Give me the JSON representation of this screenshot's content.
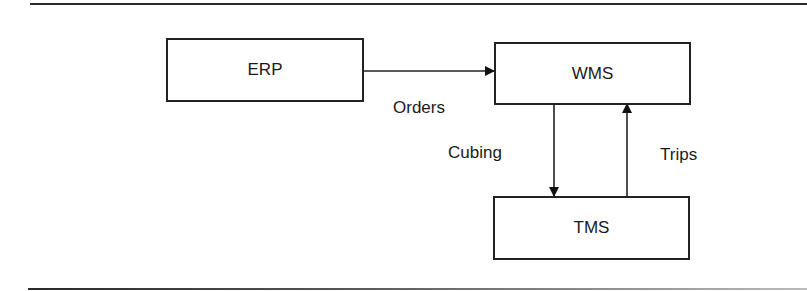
{
  "diagram": {
    "nodes": [
      {
        "id": "erp",
        "label": "ERP"
      },
      {
        "id": "wms",
        "label": "WMS"
      },
      {
        "id": "tms",
        "label": "TMS"
      }
    ],
    "edges": [
      {
        "from": "erp",
        "to": "wms",
        "label": "Orders"
      },
      {
        "from": "wms",
        "to": "tms",
        "label": "Cubing"
      },
      {
        "from": "tms",
        "to": "wms",
        "label": "Trips"
      }
    ]
  }
}
